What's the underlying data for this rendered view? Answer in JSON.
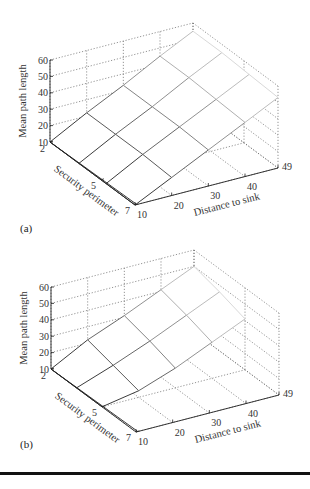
{
  "panels": {
    "a": {
      "label": "(a)"
    },
    "b": {
      "label": "(b)"
    }
  },
  "chart_data": [
    {
      "type": "surface3d",
      "panel": "(a)",
      "title": "",
      "xlabel": "Distance to sink",
      "ylabel": "Security perimeter",
      "zlabel": "Mean path length",
      "x_ticks": [
        10,
        20,
        30,
        40,
        49
      ],
      "y_ticks": [
        2,
        5,
        7
      ],
      "z_ticks": [
        10,
        20,
        30,
        40,
        50,
        60
      ],
      "xlim": [
        10,
        49
      ],
      "ylim": [
        2,
        7
      ],
      "zlim": [
        10,
        60
      ],
      "grid": true,
      "x": [
        10,
        20,
        30,
        40,
        49
      ],
      "y": [
        2,
        3.7,
        5.3,
        7
      ],
      "z": [
        [
          10,
          22,
          33,
          45,
          55
        ],
        [
          10,
          22,
          33,
          45,
          55
        ],
        [
          10,
          22,
          33,
          44,
          54
        ],
        [
          10,
          21,
          32,
          43,
          53
        ]
      ]
    },
    {
      "type": "surface3d",
      "panel": "(b)",
      "title": "",
      "xlabel": "Distance to sink",
      "ylabel": "Security perimeter",
      "zlabel": "Mean path length",
      "x_ticks": [
        10,
        20,
        30,
        40,
        49
      ],
      "y_ticks": [
        2,
        5,
        7
      ],
      "z_ticks": [
        10,
        20,
        30,
        40,
        50,
        60
      ],
      "xlim": [
        10,
        49
      ],
      "ylim": [
        2,
        7
      ],
      "zlim": [
        10,
        60
      ],
      "grid": true,
      "x": [
        10,
        20,
        30,
        40,
        49
      ],
      "y": [
        2,
        3.5,
        5
      ],
      "z": [
        [
          10,
          22,
          31,
          41,
          50
        ],
        [
          10,
          18,
          27,
          37,
          46
        ],
        [
          10,
          14,
          22,
          32,
          41
        ]
      ]
    }
  ]
}
